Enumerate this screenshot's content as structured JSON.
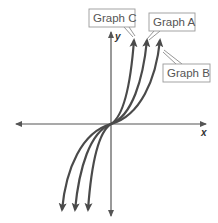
{
  "diagram": {
    "type": "coordinate-graph",
    "axes": {
      "x_label": "x",
      "y_label": "y",
      "origin": [
        0,
        0
      ]
    },
    "graphs": [
      {
        "id": "C",
        "label": "Graph C",
        "order_of_steepness": 1
      },
      {
        "id": "A",
        "label": "Graph A",
        "order_of_steepness": 2
      },
      {
        "id": "B",
        "label": "Graph B",
        "order_of_steepness": 3
      }
    ],
    "colors": {
      "curve": "#4a4a4a",
      "axis": "#555555",
      "label_border": "#9a9a9a",
      "label_text": "#555555"
    }
  }
}
